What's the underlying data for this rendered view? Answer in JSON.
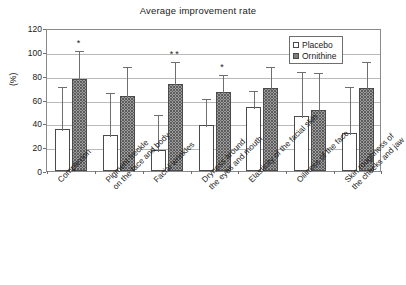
{
  "chart_data": {
    "type": "bar",
    "title": "Average improvement rate",
    "xlabel": "",
    "ylabel": "(%)",
    "ylim": [
      0,
      120
    ],
    "ytick_step": 20,
    "yticks": [
      "0",
      "20",
      "40",
      "60",
      "80",
      "100",
      "120"
    ],
    "grid": true,
    "legend_position": "top-right",
    "categories": [
      "Complexion",
      "Pigment freckle on the face and body",
      "Facial wrinkles",
      "Dryness around the eyes and mouth",
      "Elasticity of the facial skin",
      "Oiliness of the face",
      "Skin roughness of the cheeks and jaw"
    ],
    "category_lines": [
      [
        "Complexion"
      ],
      [
        "Pigment freckle",
        "on the face and body"
      ],
      [
        "Facial wrinkles"
      ],
      [
        "Dryness around",
        "the eyes and mouth"
      ],
      [
        "Elasticity of the facial skin"
      ],
      [
        "Oiliness of the face"
      ],
      [
        "Skin roughness of",
        "the cheeks and jaw"
      ]
    ],
    "series": [
      {
        "name": "Placebo",
        "color": "#ffffff",
        "values": [
          35.5,
          30.5,
          18.0,
          38.5,
          54.0,
          46.5,
          32.0
        ],
        "errors_upper": [
          36.5,
          37.0,
          30.5,
          23.5,
          14.5,
          38.0,
          40.5
        ],
        "significance": [
          "",
          "",
          "",
          "",
          "",
          "",
          ""
        ]
      },
      {
        "name": "Ornithine",
        "color": "#9d9d9d",
        "values": [
          77.5,
          63.0,
          73.0,
          66.5,
          70.0,
          51.5,
          70.0
        ],
        "errors_upper": [
          24.5,
          26.0,
          20.0,
          15.5,
          19.0,
          32.5,
          23.0
        ],
        "significance": [
          "*",
          "",
          "**",
          "*",
          "",
          "",
          ""
        ]
      }
    ]
  },
  "legend": {
    "items": [
      {
        "label": "Placebo",
        "marker": "open-square"
      },
      {
        "label": "Ornithine",
        "marker": "dotted-square"
      }
    ]
  }
}
